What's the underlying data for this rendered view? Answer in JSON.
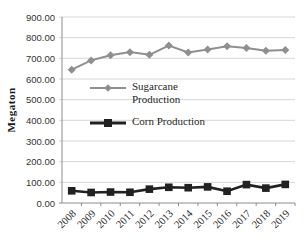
{
  "chart_data": {
    "type": "line",
    "title": "",
    "xlabel": "",
    "ylabel": "Megaton",
    "ylim": [
      0,
      900
    ],
    "ytick_step": 100,
    "ytick_decimals": 2,
    "grid": true,
    "legend_position": "inside-left-center",
    "categories": [
      "2008",
      "2009",
      "2010",
      "2011",
      "2012",
      "2013",
      "2014",
      "2015",
      "2016",
      "2017",
      "2018",
      "2019"
    ],
    "series": [
      {
        "name": "Sugarcane Production",
        "marker": "diamond",
        "color": "#8f8f8f",
        "line_width": 2,
        "values": [
          645,
          690,
          715,
          730,
          717,
          762,
          728,
          743,
          759,
          750,
          737,
          740
        ]
      },
      {
        "name": "Corn Production",
        "marker": "square",
        "color": "#212121",
        "line_width": 2.6,
        "values": [
          59,
          51,
          53,
          52,
          67,
          76,
          74,
          78,
          57,
          89,
          72,
          90
        ]
      }
    ],
    "colors": {
      "grid": "#d6d6d6",
      "axis": "#8c8c8c",
      "tick_text": "#333333",
      "background": "#ffffff"
    }
  }
}
